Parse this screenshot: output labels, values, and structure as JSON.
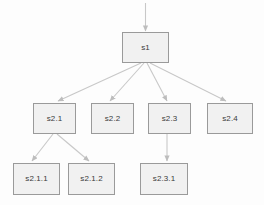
{
  "diagram": {
    "type": "state-hierarchy-tree",
    "background_color": "#fdfdfd",
    "node_fill_color": "#f1f1f1",
    "node_border_color": "#9a9a9a",
    "edge_color": "#c6c6c6",
    "label_color": "#3a3a3a",
    "nodes": [
      {
        "id": "s1",
        "label": "s1",
        "level": 1,
        "x": 122,
        "y": 32,
        "w": 47,
        "h": 31
      },
      {
        "id": "s2.1",
        "label": "s2.1",
        "level": 2,
        "x": 33,
        "y": 103,
        "w": 43,
        "h": 31
      },
      {
        "id": "s2.2",
        "label": "s2.2",
        "level": 2,
        "x": 91,
        "y": 103,
        "w": 43,
        "h": 31
      },
      {
        "id": "s2.3",
        "label": "s2.3",
        "level": 2,
        "x": 148,
        "y": 103,
        "w": 43,
        "h": 31
      },
      {
        "id": "s2.4",
        "label": "s2.4",
        "level": 2,
        "x": 207,
        "y": 103,
        "w": 46,
        "h": 31
      },
      {
        "id": "s2.1.1",
        "label": "s2.1.1",
        "level": 3,
        "x": 13,
        "y": 163,
        "w": 47,
        "h": 32
      },
      {
        "id": "s2.1.2",
        "label": "s2.1.2",
        "level": 3,
        "x": 68,
        "y": 163,
        "w": 47,
        "h": 32
      },
      {
        "id": "s2.3.1",
        "label": "s2.3.1",
        "level": 3,
        "x": 140,
        "y": 163,
        "w": 48,
        "h": 32
      }
    ],
    "edges": [
      {
        "id": "entry-to-s1",
        "from": "entry",
        "to": "s1",
        "kind": "initial-entry"
      },
      {
        "id": "s1-to-s2.1",
        "from": "s1",
        "to": "s2.1",
        "kind": "transition"
      },
      {
        "id": "s1-to-s2.2",
        "from": "s1",
        "to": "s2.2",
        "kind": "transition"
      },
      {
        "id": "s1-to-s2.3",
        "from": "s1",
        "to": "s2.3",
        "kind": "transition"
      },
      {
        "id": "s1-to-s2.4",
        "from": "s1",
        "to": "s2.4",
        "kind": "transition"
      },
      {
        "id": "s2.1-to-s2.1.1",
        "from": "s2.1",
        "to": "s2.1.1",
        "kind": "transition"
      },
      {
        "id": "s2.1-to-s2.1.2",
        "from": "s2.1",
        "to": "s2.1.2",
        "kind": "transition"
      },
      {
        "id": "s2.3-to-s2.3.1",
        "from": "s2.3",
        "to": "s2.3.1",
        "kind": "transition"
      }
    ]
  }
}
